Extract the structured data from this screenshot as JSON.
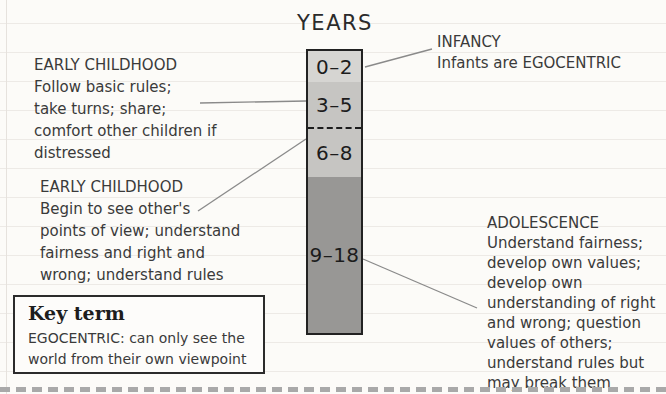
{
  "colors": {
    "paper": "#fcfbf8",
    "rule_line": "#edeae6",
    "ink": "#3a3a3a",
    "column_border": "#222222",
    "connector": "#8a8a8a",
    "cut_line": "#a9a9a9"
  },
  "title": "YEARS",
  "column": {
    "segments": [
      {
        "label": "0–2",
        "color": "#d6d5d2"
      },
      {
        "label": "3–5",
        "color": "#c6c5c2"
      },
      {
        "label": "6–8",
        "color": "#c6c5c2"
      },
      {
        "label": "9–18",
        "color": "#989795"
      }
    ]
  },
  "annotations": {
    "infancy": {
      "heading": "INFANCY",
      "lines": [
        "Infants are EGOCENTRIC"
      ]
    },
    "early_childhood_1": {
      "heading": "EARLY CHILDHOOD",
      "lines": [
        "Follow basic rules;",
        "take turns; share;",
        "comfort other children if",
        "distressed"
      ]
    },
    "early_childhood_2": {
      "heading": "EARLY CHILDHOOD",
      "lines": [
        "Begin to see other's",
        "points of view; understand",
        "fairness and right and",
        "wrong; understand rules"
      ]
    },
    "adolescence": {
      "heading": "ADOLESCENCE",
      "lines": [
        "Understand fairness;",
        "develop own values;",
        "develop own",
        "understanding of right",
        "and wrong; question",
        "values of others;",
        "understand rules but",
        "may break them"
      ]
    }
  },
  "key_term": {
    "heading": "Key term",
    "lines": [
      "EGOCENTRIC: can only see the",
      "world from their own viewpoint"
    ]
  }
}
